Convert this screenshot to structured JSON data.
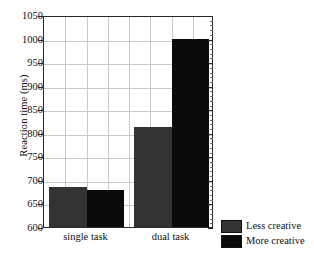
{
  "chart_data": {
    "type": "bar",
    "title": "",
    "subtitle": "",
    "xlabel": "",
    "ylabel": "Reaction time (ms)",
    "categories": [
      "single task",
      "dual task"
    ],
    "series": [
      {
        "name": "Less creative",
        "color": "#333333",
        "values": [
          684,
          813
        ]
      },
      {
        "name": "More creative",
        "color": "#0a0a0a",
        "values": [
          678,
          1000
        ]
      }
    ],
    "ylim": [
      600,
      1050
    ],
    "ytick_step": 50,
    "yticks": [
      600,
      650,
      700,
      750,
      800,
      850,
      900,
      950,
      1000,
      1050
    ],
    "ytick_labels": [
      "600",
      "650",
      "700",
      "750",
      "800",
      "850",
      "900",
      "950",
      "1000",
      "1050"
    ],
    "grid": true,
    "grid_vertical_count": 8,
    "legend_position": "bottom-right-outside",
    "frame": true
  },
  "legend": {
    "items": [
      {
        "label": "Less creative",
        "color": "#333333"
      },
      {
        "label": "More creative",
        "color": "#0a0a0a"
      }
    ]
  }
}
